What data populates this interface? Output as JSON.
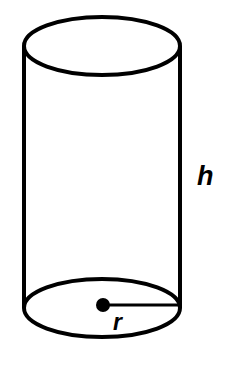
{
  "figure": {
    "kind": "cylinder-diagram",
    "background_color": "#ffffff",
    "stroke_color": "#000000"
  },
  "geometry": {
    "canvas": {
      "width": 225,
      "height": 365
    },
    "top_ellipse": {
      "cx": 102,
      "cy": 46,
      "rx": 78,
      "ry": 29,
      "stroke_width": 4
    },
    "bottom_ellipse": {
      "cx": 102,
      "cy": 308,
      "rx": 78,
      "ry": 29,
      "stroke_width": 4
    },
    "left_side": {
      "x1": 24,
      "y1": 46,
      "x2": 24,
      "y2": 308,
      "stroke_width": 4
    },
    "right_side": {
      "x1": 180,
      "y1": 46,
      "x2": 180,
      "y2": 308,
      "stroke_width": 4
    },
    "center_dot": {
      "cx": 103,
      "cy": 305,
      "r": 7
    },
    "radius_line": {
      "x1": 103,
      "y1": 305,
      "x2": 180,
      "y2": 305,
      "stroke_width": 3
    }
  },
  "labels": {
    "height": {
      "text": "h",
      "name": "height-label",
      "x": 197,
      "y": 185
    },
    "radius": {
      "text": "r",
      "name": "radius-label",
      "x": 113,
      "y": 330
    }
  }
}
